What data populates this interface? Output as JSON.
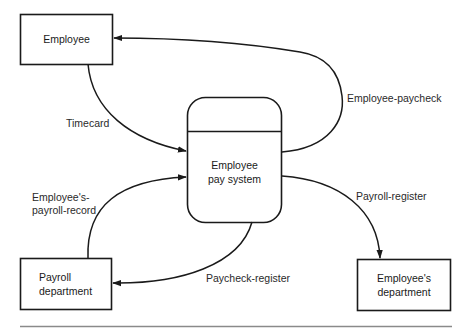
{
  "diagram": {
    "type": "data-flow-diagram",
    "colors": {
      "stroke": "#1a1a1a",
      "rule": "#8a8a8a",
      "background": "#ffffff"
    },
    "entities": {
      "employee": {
        "label": "Employee"
      },
      "payroll_department": {
        "line1": "Payroll",
        "line2": "department"
      },
      "employees_department": {
        "line1": "Employee's",
        "line2": "department"
      }
    },
    "process": {
      "line1": "Employee",
      "line2": "pay system"
    },
    "flows": {
      "timecard": {
        "label": "Timecard",
        "from": "Employee",
        "to": "Employee pay system"
      },
      "employee_paycheck": {
        "label": "Employee-paycheck",
        "from": "Employee pay system",
        "to": "Employee"
      },
      "payroll_record": {
        "line1": "Employee's-",
        "line2": "payroll-record",
        "from": "Payroll department",
        "to": "Employee pay system"
      },
      "paycheck_register": {
        "label": "Paycheck-register",
        "from": "Employee pay system",
        "to": "Payroll department"
      },
      "payroll_register": {
        "label": "Payroll-register",
        "from": "Employee pay system",
        "to": "Employee's department"
      }
    }
  }
}
